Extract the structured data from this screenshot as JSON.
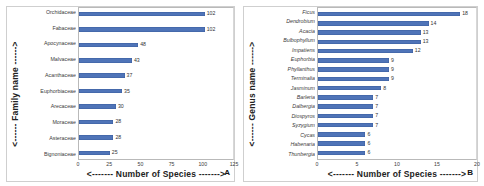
{
  "figure": {
    "background": "#ffffff",
    "bar_color": "#4f74b8",
    "panels": [
      {
        "letter": "A",
        "ytitle": "<------ Family name ------>",
        "xtitle": "<------- Number of Species ------->"
      },
      {
        "letter": "B",
        "ytitle": "<------ Genus name ------>",
        "xtitle": "<------- Number of Species ------->"
      }
    ]
  },
  "chart_data": [
    {
      "type": "bar",
      "orientation": "horizontal",
      "panel": "A",
      "title": "",
      "xlabel": "<------- Number of Species ------->",
      "ylabel": "<------ Family name ------>",
      "categories": [
        "Orchidaceae",
        "Fabaceae",
        "Apocynaceae",
        "Malvaceae",
        "Acanthaceae",
        "Euphorbiaceae",
        "Arecaceae",
        "Moraceae",
        "Asteraceae",
        "Bignoniaceae"
      ],
      "values": [
        102,
        102,
        48,
        43,
        37,
        35,
        30,
        28,
        28,
        25
      ],
      "xlim": [
        0,
        125
      ],
      "xticks": [
        0,
        25,
        50,
        75,
        100,
        125
      ],
      "grid": false,
      "legend": "none",
      "data_labels": true,
      "color": "#4f74b8"
    },
    {
      "type": "bar",
      "orientation": "horizontal",
      "panel": "B",
      "title": "",
      "xlabel": "<------- Number of Species ------->",
      "ylabel": "<------ Genus name ------>",
      "categories": [
        "Ficus",
        "Dendrobium",
        "Acacia",
        "Bulbophyllum",
        "Impatiens",
        "Euphorbia",
        "Phyllanthus",
        "Terminalia",
        "Jasminum",
        "Barleria",
        "Dalbergia",
        "Diospyros",
        "Syzygium",
        "Cycas",
        "Habenaria",
        "Thunbergia"
      ],
      "values": [
        18,
        14,
        13,
        13,
        12,
        9,
        9,
        9,
        8,
        7,
        7,
        7,
        7,
        6,
        6,
        6
      ],
      "xlim": [
        0,
        20
      ],
      "xticks": [
        0,
        5,
        10,
        15,
        20
      ],
      "grid": false,
      "legend": "none",
      "data_labels": true,
      "color": "#4f74b8"
    }
  ]
}
